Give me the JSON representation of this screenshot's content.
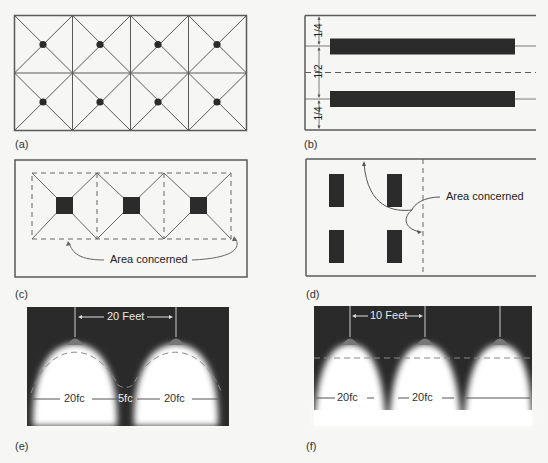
{
  "figure": {
    "panels": [
      {
        "id": "a",
        "caption": "(a)"
      },
      {
        "id": "b",
        "caption": "(b)",
        "dimensions": [
          "1/4",
          "1/2",
          "1/4"
        ]
      },
      {
        "id": "c",
        "caption": "(c)",
        "annotation": "Area concerned"
      },
      {
        "id": "d",
        "caption": "(d)",
        "annotation": "Area concerned"
      },
      {
        "id": "e",
        "caption": "(e)",
        "spacing_label": "20 Feet",
        "levels": [
          "20fc",
          "5fc",
          "20fc"
        ]
      },
      {
        "id": "f",
        "caption": "(f)",
        "spacing_label": "10 Feet",
        "levels": [
          "20fc",
          "20fc"
        ]
      }
    ]
  },
  "colors": {
    "line": "#555555",
    "fixture": "#2b2b2b",
    "dark_bg": "#2a2a2a",
    "light": "#ffffff",
    "lamp": "#7a7a7a"
  }
}
